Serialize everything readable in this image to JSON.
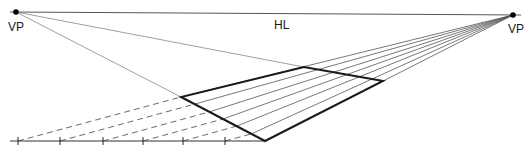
{
  "diagram": {
    "labels": {
      "vp_left": "VP",
      "vp_right": "VP",
      "horizon": "HL"
    },
    "colors": {
      "background": "#ffffff",
      "thin_line": "#555555",
      "thick_line": "#1a1a1a",
      "dashed_line": "#444444",
      "point": "#000000"
    },
    "points": {
      "vp_left": [
        16,
        12
      ],
      "vp_right": [
        513,
        15
      ],
      "front_corner": [
        265,
        141
      ],
      "left_corner": [
        181,
        97
      ],
      "far_corner": [
        304,
        67
      ],
      "right_corner": [
        383,
        81
      ]
    },
    "ground_line": {
      "x1": 10,
      "x2": 265,
      "y": 141
    },
    "ticks_x": [
      18,
      60,
      103,
      143,
      183,
      225
    ],
    "measuring_line_count": 6
  }
}
